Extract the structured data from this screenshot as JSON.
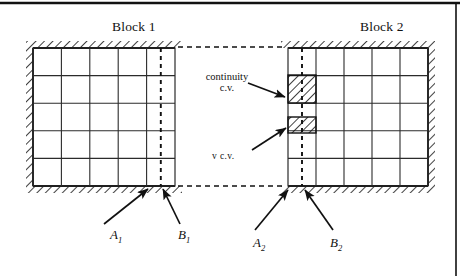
{
  "figure": {
    "blocks": [
      {
        "id": "block-1",
        "title": "Block 1",
        "title_x": 112,
        "title_y": 20,
        "x": 33,
        "y": 48,
        "width": 142,
        "height": 138,
        "cols": 5,
        "rows": 5,
        "walls": [
          "top",
          "left",
          "bottom"
        ],
        "hatch_side": "inside",
        "dashed_line_x_fraction": 0.9
      },
      {
        "id": "block-2",
        "title": "Block 2",
        "title_x": 360,
        "title_y": 20,
        "x": 288,
        "y": 48,
        "width": 140,
        "height": 138,
        "cols": 5,
        "rows": 5,
        "walls": [
          "top",
          "right",
          "bottom"
        ],
        "hatch_side": "inside",
        "dashed_line_x_fraction": 0.1
      }
    ],
    "interface_lines": [
      {
        "name": "top-interface",
        "x1": 178,
        "y1": 47,
        "x2": 286,
        "y2": 47
      },
      {
        "name": "bottom-interface",
        "x1": 178,
        "y1": 186,
        "x2": 286,
        "y2": 186
      }
    ],
    "control_volumes": [
      {
        "id": "continuity-cv",
        "label_line1": "continuity",
        "label_line2": "c.v.",
        "label_x": 196,
        "label_y": 71,
        "label_width": 62,
        "x": 288,
        "y": 75,
        "width": 28,
        "height": 28,
        "arrow": {
          "x1": 248,
          "y1": 83,
          "x2": 285,
          "y2": 97
        }
      },
      {
        "id": "v-cv",
        "label_line1": "v c.v.",
        "label_x": 212,
        "label_y": 152,
        "label_width": 46,
        "x": 288,
        "y": 117,
        "width": 28,
        "height": 16,
        "arrow": {
          "x1": 252,
          "y1": 150,
          "x2": 286,
          "y2": 128
        }
      }
    ],
    "annotations": [
      {
        "id": "label-a1",
        "text": "A",
        "subscript": "1",
        "text_x": 110,
        "text_y": 228,
        "arrow": {
          "x1": 104,
          "y1": 224,
          "x2": 148,
          "y2": 189
        }
      },
      {
        "id": "label-b1",
        "text": "B",
        "subscript": "1",
        "text_x": 178,
        "text_y": 228,
        "arrow": {
          "x1": 180,
          "y1": 224,
          "x2": 163,
          "y2": 189
        }
      },
      {
        "id": "label-a2",
        "text": "A",
        "subscript": "2",
        "text_x": 253,
        "text_y": 236,
        "arrow": {
          "x1": 255,
          "y1": 230,
          "x2": 288,
          "y2": 190
        }
      },
      {
        "id": "label-b2",
        "text": "B",
        "subscript": "2",
        "text_x": 330,
        "text_y": 236,
        "arrow": {
          "x1": 333,
          "y1": 230,
          "x2": 305,
          "y2": 190
        }
      }
    ],
    "border": {
      "top_rule_y": 3,
      "right_rule_x": 456
    },
    "colors": {
      "line": "#111111",
      "grid": "#2b2b2b",
      "hatch": "#111111",
      "background": "#ffffff",
      "text": "#111111"
    }
  }
}
